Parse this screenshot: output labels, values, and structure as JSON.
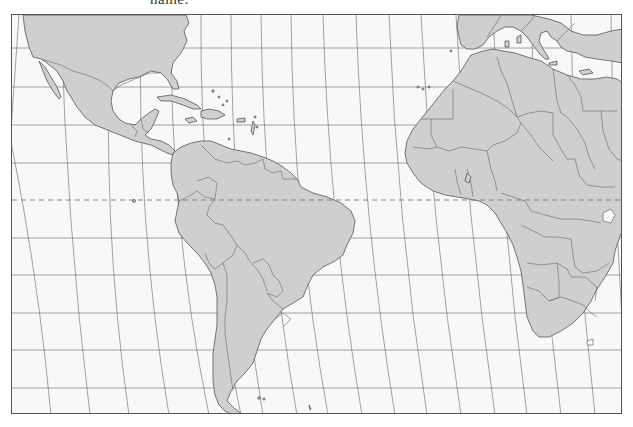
{
  "page": {
    "caption_fragment": "name:"
  },
  "map": {
    "type": "outline-map",
    "projection": "curved-meridian (Robinson-like)",
    "region": "Atlantic Ocean: Americas, Europe (south), Africa",
    "colors": {
      "land": "#cfcfcf",
      "ocean": "#f8f8f8",
      "border": "#555555",
      "graticule": "#666666",
      "equator": "#777777"
    },
    "features": {
      "equator": {
        "style": "dashed",
        "label": ""
      },
      "graticule": {
        "parallels_count": 10,
        "meridians_count": 17
      },
      "continents": [
        "North America",
        "Central America",
        "Caribbean",
        "South America",
        "Europe",
        "Africa"
      ]
    }
  }
}
